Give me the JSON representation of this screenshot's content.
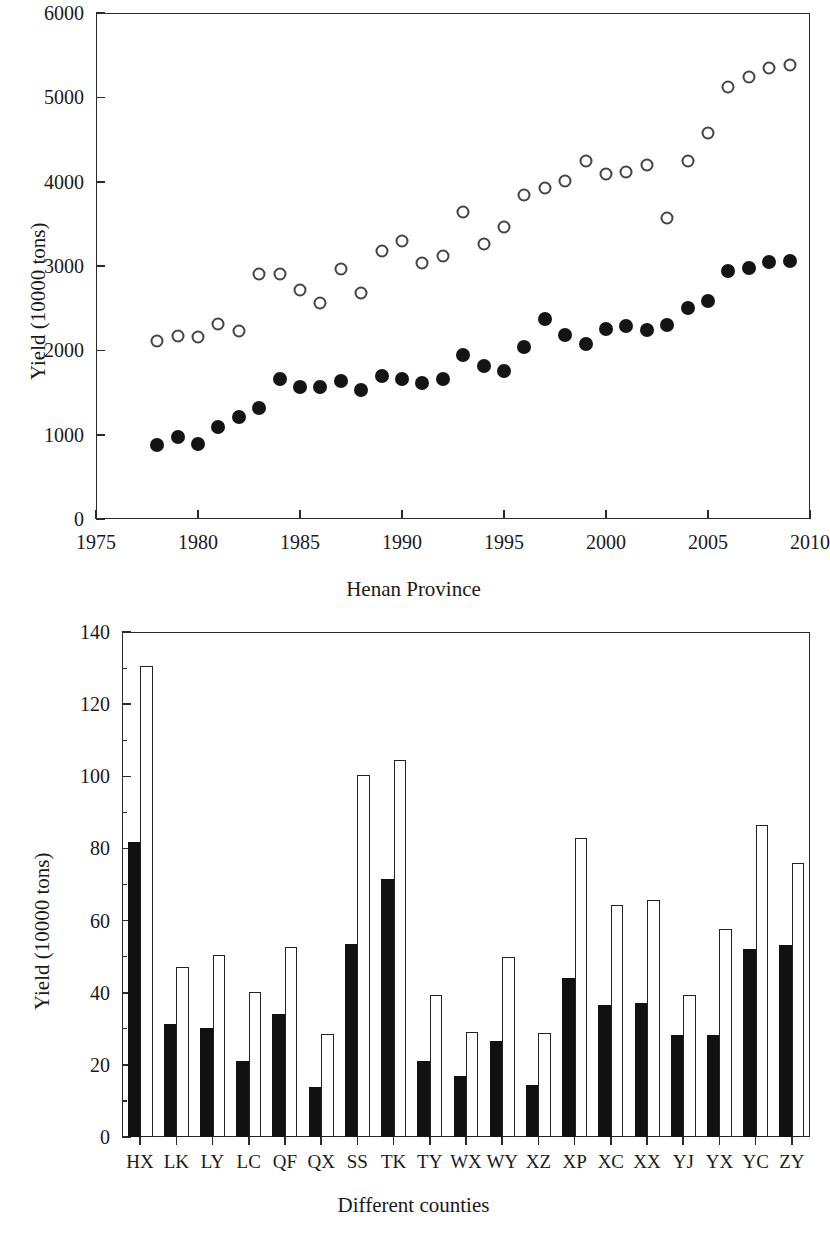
{
  "figure": {
    "panels": [
      "A",
      "B"
    ]
  },
  "chart_data": [
    {
      "panel": "A",
      "type": "scatter",
      "title": "",
      "xlabel": "Henan Province",
      "ylabel": "Yield (10000 tons)",
      "xlim": [
        1975,
        2010
      ],
      "ylim": [
        0,
        6000
      ],
      "xticks": [
        1975,
        1980,
        1985,
        1990,
        1995,
        2000,
        2005,
        2010
      ],
      "yticks": [
        0,
        1000,
        2000,
        3000,
        4000,
        5000,
        6000
      ],
      "grid": false,
      "legend_position": "top-center",
      "panel_letter": "A",
      "x": [
        1978,
        1979,
        1980,
        1981,
        1982,
        1983,
        1984,
        1985,
        1986,
        1987,
        1988,
        1989,
        1990,
        1991,
        1992,
        1993,
        1994,
        1995,
        1996,
        1997,
        1998,
        1999,
        2000,
        2001,
        2002,
        2003,
        2004,
        2005,
        2006,
        2007,
        2008,
        2009
      ],
      "series": [
        {
          "name": "Wheat yield",
          "marker": "filled-circle",
          "values": [
            880,
            975,
            895,
            1090,
            1205,
            1320,
            1665,
            1560,
            1570,
            1640,
            1530,
            1700,
            1660,
            1610,
            1660,
            1945,
            1810,
            1760,
            2035,
            2370,
            2180,
            2080,
            2250,
            2290,
            2240,
            2295,
            2500,
            2590,
            2935,
            2975,
            3050,
            3060
          ]
        },
        {
          "name": "Total crop production",
          "marker": "open-circle",
          "values": [
            2110,
            2175,
            2160,
            2310,
            2230,
            2905,
            2900,
            2715,
            2565,
            2965,
            2680,
            3180,
            3295,
            3030,
            3120,
            3640,
            3265,
            3465,
            3840,
            3930,
            4010,
            4250,
            4090,
            4110,
            4200,
            3575,
            4250,
            4575,
            5120,
            5240,
            5345,
            5385
          ]
        }
      ]
    },
    {
      "panel": "B",
      "type": "bar",
      "title": "",
      "xlabel": "Different counties",
      "ylabel": "Yield (10000 tons)",
      "ylim": [
        0,
        140
      ],
      "yticks": [
        0,
        20,
        40,
        60,
        80,
        100,
        120,
        140
      ],
      "grid": false,
      "legend_position": "top-center",
      "panel_letter": "B",
      "categories": [
        "HX",
        "LK",
        "LY",
        "LC",
        "QF",
        "QX",
        "SS",
        "TK",
        "TY",
        "WX",
        "WY",
        "XZ",
        "XP",
        "XC",
        "XX",
        "YJ",
        "YX",
        "YC",
        "ZY"
      ],
      "series": [
        {
          "name": "Wheat yield",
          "fill": "solid",
          "values": [
            81.8,
            31.2,
            30.1,
            21.0,
            34.2,
            13.8,
            53.4,
            71.5,
            21.0,
            16.8,
            26.5,
            14.5,
            44.2,
            36.5,
            37.2,
            28.3,
            28.4,
            52.0,
            53.3
          ]
        },
        {
          "name": "Total crop production",
          "fill": "open",
          "values": [
            130.6,
            47.2,
            50.5,
            40.2,
            52.8,
            28.6,
            100.3,
            104.5,
            39.4,
            29.1,
            49.8,
            28.7,
            82.9,
            64.2,
            65.8,
            39.5,
            57.8,
            86.6,
            75.9
          ]
        }
      ]
    }
  ],
  "panelA": {
    "letter": "A",
    "ylabel": "Yield (10000 tons)",
    "xlabel": "Henan Province",
    "legend": [
      {
        "label": "Wheat yield",
        "marker": "filled-circle-icon"
      },
      {
        "label": "Total crop production",
        "marker": "open-circle-icon"
      }
    ],
    "yticks": [
      "6000",
      "5000",
      "4000",
      "3000",
      "2000",
      "1000",
      "0"
    ],
    "xticks": [
      "1975",
      "1980",
      "1985",
      "1990",
      "1995",
      "2000",
      "2005",
      "2010"
    ]
  },
  "panelB": {
    "letter": "B",
    "ylabel": "Yield (10000 tons)",
    "xlabel": "Different counties",
    "legend": [
      {
        "label": "Wheat yield",
        "marker": "filled-swatch-icon"
      },
      {
        "label": "Total crop production",
        "marker": "open-swatch-icon"
      }
    ],
    "yticks": [
      "140",
      "120",
      "100",
      "80",
      "60",
      "40",
      "20",
      "0"
    ],
    "xticks": [
      "HX",
      "LK",
      "LY",
      "LC",
      "QF",
      "QX",
      "SS",
      "TK",
      "TY",
      "WX",
      "WY",
      "XZ",
      "XP",
      "XC",
      "XX",
      "YJ",
      "YX",
      "YC",
      "ZY"
    ]
  }
}
